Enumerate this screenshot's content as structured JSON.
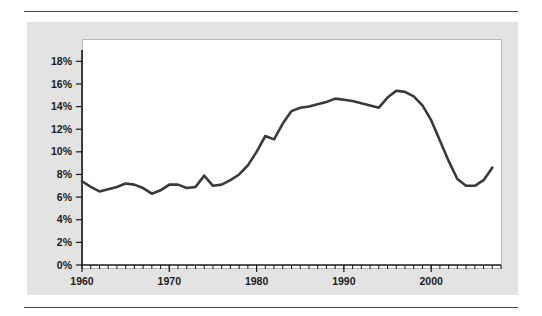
{
  "page": {
    "background": "#ffffff",
    "panel_color": "#e3e3e3",
    "rule_color": "#4a4a4a",
    "plot_background": "#ffffff"
  },
  "chart_data": {
    "type": "line",
    "title": "",
    "subtitle": "",
    "xlabel": "",
    "ylabel": "",
    "xlim": [
      1960,
      2008
    ],
    "ylim": [
      0,
      19
    ],
    "grid": false,
    "legend": "none",
    "line_color": "#3a3a3a",
    "line_width": 2.6,
    "y_ticks": [
      0,
      2,
      4,
      6,
      8,
      10,
      12,
      14,
      16,
      18
    ],
    "y_tick_labels": [
      "0%",
      "2%",
      "4%",
      "6%",
      "8%",
      "10%",
      "12%",
      "14%",
      "16%",
      "18%"
    ],
    "x_major_ticks": [
      1960,
      1970,
      1980,
      1990,
      2000
    ],
    "x_major_tick_labels": [
      "1960",
      "1970",
      "1980",
      "1990",
      "2000"
    ],
    "x_minor_tick_step": 1,
    "series": [
      {
        "name": "series-1",
        "x": [
          1960,
          1961,
          1962,
          1963,
          1964,
          1965,
          1966,
          1967,
          1968,
          1969,
          1970,
          1971,
          1972,
          1973,
          1974,
          1975,
          1976,
          1977,
          1978,
          1979,
          1980,
          1981,
          1982,
          1983,
          1984,
          1985,
          1986,
          1987,
          1988,
          1989,
          1990,
          1991,
          1992,
          1993,
          1994,
          1995,
          1996,
          1997,
          1998,
          1999,
          2000,
          2001,
          2002,
          2003,
          2004,
          2005,
          2006,
          2007
        ],
        "values": [
          7.4,
          6.9,
          6.5,
          6.7,
          6.9,
          7.2,
          7.1,
          6.8,
          6.3,
          6.6,
          7.1,
          7.1,
          6.8,
          6.9,
          7.9,
          7.0,
          7.1,
          7.5,
          8.0,
          8.8,
          10.0,
          11.4,
          11.1,
          12.5,
          13.6,
          13.9,
          14.0,
          14.2,
          14.4,
          14.7,
          14.6,
          14.5,
          14.3,
          14.1,
          13.9,
          14.8,
          15.4,
          15.3,
          14.9,
          14.1,
          12.8,
          11.0,
          9.2,
          7.6,
          7.0,
          7.0,
          7.5,
          8.6
        ]
      }
    ]
  }
}
